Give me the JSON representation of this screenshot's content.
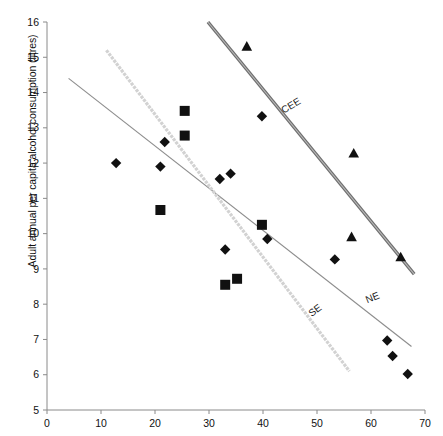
{
  "chart_data": {
    "type": "scatter",
    "title": "",
    "xlabel": "",
    "ylabel": "Adult annual per capita alcohol consumption (litres)",
    "xlim": [
      0,
      70
    ],
    "ylim": [
      5,
      16
    ],
    "xticks": [
      0,
      10,
      20,
      30,
      40,
      50,
      60,
      70
    ],
    "yticks": [
      5,
      6,
      7,
      8,
      9,
      10,
      11,
      12,
      13,
      14,
      15,
      16
    ],
    "grid": false,
    "legend": "inline-line-labels",
    "series": [
      {
        "name": "NE",
        "marker": "diamond",
        "color": "#111111",
        "points": [
          {
            "x": 12.8,
            "y": 12.0
          },
          {
            "x": 21.8,
            "y": 12.6
          },
          {
            "x": 21.0,
            "y": 11.9
          },
          {
            "x": 32.0,
            "y": 11.55
          },
          {
            "x": 34.0,
            "y": 11.7
          },
          {
            "x": 33.0,
            "y": 9.55
          },
          {
            "x": 40.8,
            "y": 9.85
          },
          {
            "x": 39.8,
            "y": 13.33
          },
          {
            "x": 53.3,
            "y": 9.27
          },
          {
            "x": 63.0,
            "y": 6.97
          },
          {
            "x": 64.0,
            "y": 6.53
          },
          {
            "x": 66.8,
            "y": 6.02
          }
        ],
        "trendline": {
          "x1": 4.0,
          "y1": 14.4,
          "x2": 67.5,
          "y2": 6.8
        }
      },
      {
        "name": "SE",
        "marker": "square",
        "color": "#111111",
        "points": [
          {
            "x": 25.5,
            "y": 13.48
          },
          {
            "x": 25.5,
            "y": 12.78
          },
          {
            "x": 21.0,
            "y": 10.67
          },
          {
            "x": 39.8,
            "y": 10.25
          },
          {
            "x": 33.0,
            "y": 8.55
          },
          {
            "x": 35.2,
            "y": 8.72
          }
        ],
        "trendline": {
          "x1": 11.0,
          "y1": 15.2,
          "x2": 56.0,
          "y2": 6.1
        }
      },
      {
        "name": "CEE",
        "marker": "triangle",
        "color": "#111111",
        "points": [
          {
            "x": 37.0,
            "y": 15.3
          },
          {
            "x": 56.8,
            "y": 12.27
          },
          {
            "x": 56.4,
            "y": 9.9
          },
          {
            "x": 65.5,
            "y": 9.33
          }
        ],
        "trendline": {
          "x1": 29.8,
          "y1": 16.0,
          "x2": 68.0,
          "y2": 8.85
        }
      }
    ],
    "annotations": [
      {
        "text": "CEE",
        "x": 45.5,
        "y": 13.55,
        "rotation": -31
      },
      {
        "text": "NE",
        "x": 60.5,
        "y": 8.1,
        "rotation": -22
      },
      {
        "text": "SE",
        "x": 50.0,
        "y": 7.75,
        "rotation": -37
      }
    ]
  },
  "axes": {
    "y_tick_labels": [
      "16",
      "15",
      "14",
      "13",
      "12",
      "11",
      "10",
      "9",
      "8",
      "7",
      "6",
      "5"
    ],
    "x_tick_labels": [
      "0",
      "10",
      "20",
      "30",
      "40",
      "50",
      "60",
      "70"
    ]
  },
  "colors": {
    "cee_line": "#6e6e6e",
    "ne_line": "#8c8c8c",
    "se_line": "#d2d2d2",
    "marker": "#111111",
    "axis": "#8a8a8a",
    "text": "#111111"
  }
}
